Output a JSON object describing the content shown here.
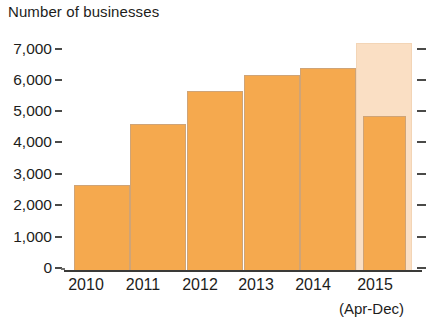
{
  "chart_data": {
    "type": "bar",
    "title": "Number of businesses",
    "subtitle": "",
    "xlabel": "",
    "ylabel": "",
    "categories": [
      "2010",
      "2011",
      "2012",
      "2013",
      "2014",
      "2015"
    ],
    "values": [
      2600,
      4450,
      5450,
      5950,
      6150,
      4700
    ],
    "series": [
      {
        "name": "Number of businesses",
        "values": [
          2600,
          4450,
          5450,
          5950,
          6150,
          4700
        ]
      },
      {
        "name": "Projected full-year total",
        "values": [
          null,
          null,
          null,
          null,
          null,
          6900
        ]
      }
    ],
    "ylim": [
      0,
      7000
    ],
    "yticks": [
      0,
      1000,
      2000,
      3000,
      4000,
      5000,
      6000,
      7000
    ],
    "ytick_labels": [
      "0",
      "1,000",
      "2,000",
      "3,000",
      "4,000",
      "5,000",
      "6,000",
      "7,000"
    ],
    "grid": false,
    "legend": "none",
    "annotations": [
      "(Apr-Dec)"
    ],
    "colors": {
      "bar": "#f5a94e",
      "bar_border": "#cfa477",
      "ghost_bar": "#fadfc4",
      "ghost_bar_border": "#f3d5b6",
      "axis": "#3a3a38",
      "text": "#1d1d1b",
      "background": "#ffffff"
    }
  },
  "axis": {
    "note": "(Apr-Dec)"
  }
}
